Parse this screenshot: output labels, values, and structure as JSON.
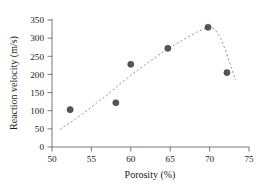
{
  "chart_data": {
    "type": "scatter",
    "title": "",
    "xlabel": "Porosity (%)",
    "ylabel": "Reaction velocity (m/s)",
    "xlim": [
      50,
      75
    ],
    "ylim": [
      0,
      350
    ],
    "xticks": [
      50,
      55,
      60,
      65,
      70,
      75
    ],
    "yticks": [
      0,
      50,
      100,
      150,
      200,
      250,
      300,
      350
    ],
    "xtick_labels": [
      "50",
      "55",
      "60",
      "65",
      "70",
      "75"
    ],
    "ytick_labels": [
      "0",
      "50",
      "100",
      "150",
      "200",
      "250",
      "300",
      "350"
    ],
    "grid": false,
    "legend": null,
    "marker_color": "#555555",
    "curve_color": "#9a9a9a",
    "curve_style": "dashed",
    "series": [
      {
        "name": "Measured points",
        "marker": "circle",
        "points": [
          {
            "x": 52.3,
            "y": 103
          },
          {
            "x": 58.1,
            "y": 122
          },
          {
            "x": 60.0,
            "y": 228
          },
          {
            "x": 64.7,
            "y": 272
          },
          {
            "x": 69.8,
            "y": 330
          },
          {
            "x": 72.2,
            "y": 205
          }
        ]
      },
      {
        "name": "Fitted trend",
        "style": "dashed-line",
        "points": [
          {
            "x": 51.0,
            "y": 48
          },
          {
            "x": 53.0,
            "y": 77
          },
          {
            "x": 55.0,
            "y": 110
          },
          {
            "x": 57.0,
            "y": 144
          },
          {
            "x": 59.0,
            "y": 180
          },
          {
            "x": 61.0,
            "y": 214
          },
          {
            "x": 63.0,
            "y": 245
          },
          {
            "x": 65.0,
            "y": 275
          },
          {
            "x": 67.0,
            "y": 300
          },
          {
            "x": 68.5,
            "y": 318
          },
          {
            "x": 69.8,
            "y": 330
          },
          {
            "x": 70.6,
            "y": 326
          },
          {
            "x": 71.3,
            "y": 305
          },
          {
            "x": 72.0,
            "y": 268
          },
          {
            "x": 72.7,
            "y": 222
          },
          {
            "x": 73.3,
            "y": 185
          }
        ]
      }
    ]
  },
  "axes": {
    "x_axis_name": "porosity-axis",
    "y_axis_name": "reaction-velocity-axis"
  }
}
